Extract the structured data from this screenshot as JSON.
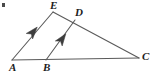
{
  "figure": {
    "background_color": "#ffffff",
    "stroke_color": "#5a5a5a",
    "label_color": "#1c1c1c",
    "stroke_width": 1.1,
    "corner_mark": {
      "present": true,
      "color": "#4a4a4a",
      "x": 2,
      "y": 3
    },
    "points": {
      "A": {
        "label": "A",
        "x": 12,
        "y": 60,
        "label_x": 9,
        "label_y": 62
      },
      "B": {
        "label": "B",
        "x": 46,
        "y": 60,
        "label_x": 43,
        "label_y": 62
      },
      "C": {
        "label": "C",
        "x": 139,
        "y": 58,
        "label_x": 142,
        "label_y": 51
      },
      "D": {
        "label": "D",
        "x": 75,
        "y": 20,
        "label_x": 75,
        "label_y": 7
      },
      "E": {
        "label": "E",
        "x": 53,
        "y": 12,
        "label_x": 50,
        "label_y": 0
      }
    },
    "segments": [
      {
        "name": "AC",
        "from": "A",
        "to": "C"
      },
      {
        "name": "AE",
        "from": "A",
        "to": "E"
      },
      {
        "name": "EC",
        "from": "E",
        "to": "C"
      },
      {
        "name": "BD",
        "from": "B",
        "to": "D"
      }
    ],
    "parallel_marks": [
      {
        "name": "arrow-on-AE",
        "segment": "AE",
        "x": 33,
        "y": 32,
        "angle_deg": -49.5,
        "count": 1
      },
      {
        "name": "arrow-on-BD",
        "segment": "BD",
        "x": 62,
        "y": 39,
        "angle_deg": -49.0,
        "count": 1
      }
    ],
    "labels": [
      "A",
      "B",
      "C",
      "D",
      "E"
    ]
  }
}
